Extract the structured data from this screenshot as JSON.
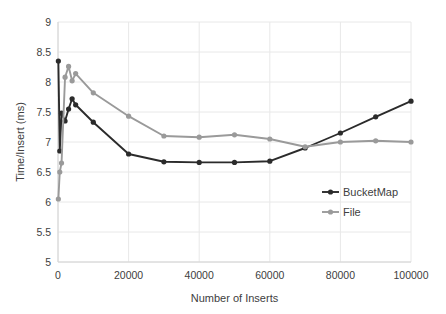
{
  "chart_data": {
    "type": "line",
    "title": "",
    "xlabel": "Number of Inserts",
    "ylabel": "Time/Insert (ms)",
    "xlim": [
      0,
      100000
    ],
    "ylim": [
      5,
      9
    ],
    "xticks": [
      0,
      20000,
      40000,
      60000,
      80000,
      100000
    ],
    "xticklabels": [
      "0",
      "20000",
      "40000",
      "60000",
      "80000",
      "100000"
    ],
    "yticks": [
      5,
      5.5,
      6,
      6.5,
      7,
      7.5,
      8,
      8.5,
      9
    ],
    "yticklabels": [
      "5",
      "5.5",
      "6",
      "6.5",
      "7",
      "7.5",
      "8",
      "8.5",
      "9"
    ],
    "grid": true,
    "grid_color": "#e8e8e8",
    "legend_position": "inside-right",
    "series": [
      {
        "name": "BucketMap",
        "color": "#2b2b2b",
        "x": [
          100,
          500,
          1000,
          2000,
          3000,
          4000,
          5000,
          10000,
          20000,
          30000,
          40000,
          50000,
          60000,
          70000,
          80000,
          90000,
          100000
        ],
        "y": [
          8.35,
          6.85,
          7.48,
          7.35,
          7.55,
          7.72,
          7.62,
          7.33,
          6.8,
          6.67,
          6.66,
          6.66,
          6.68,
          6.9,
          7.15,
          7.42,
          7.68
        ]
      },
      {
        "name": "File",
        "color": "#9a9a9a",
        "x": [
          100,
          500,
          1000,
          2000,
          3000,
          4000,
          5000,
          10000,
          20000,
          30000,
          40000,
          50000,
          60000,
          70000,
          80000,
          90000,
          100000
        ],
        "y": [
          6.05,
          6.5,
          6.65,
          8.08,
          8.26,
          8.02,
          8.14,
          7.82,
          7.43,
          7.1,
          7.08,
          7.12,
          7.05,
          6.92,
          7.0,
          7.02,
          7.0
        ]
      }
    ]
  }
}
